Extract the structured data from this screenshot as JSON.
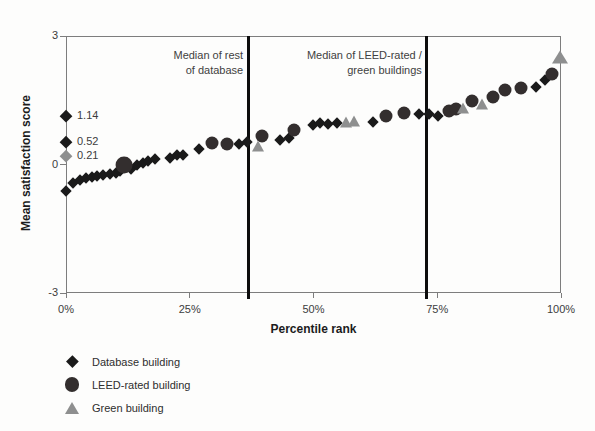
{
  "chart_data": {
    "type": "scatter",
    "title": "",
    "xlabel": "Percentile rank",
    "ylabel": "Mean satisfaction score",
    "xlim": [
      0,
      100
    ],
    "ylim": [
      -3,
      3
    ],
    "grid": false,
    "legend_position": "bottom-left",
    "xticks": [
      {
        "value": 0,
        "label": "0%"
      },
      {
        "value": 25,
        "label": "25%"
      },
      {
        "value": 50,
        "label": "50%"
      },
      {
        "value": 75,
        "label": "75%"
      },
      {
        "value": 100,
        "label": "100%"
      }
    ],
    "yticks": [
      {
        "value": 3,
        "label": "3"
      },
      {
        "value": 0,
        "label": "0"
      },
      {
        "value": -3,
        "label": "-3"
      }
    ],
    "series": [
      {
        "name": "Database building",
        "shape": "diamond",
        "color": "#1a1a1a",
        "points": [
          [
            0,
            -0.62
          ],
          [
            1.5,
            -0.44
          ],
          [
            2.8,
            -0.37
          ],
          [
            4.0,
            -0.32
          ],
          [
            5.2,
            -0.29
          ],
          [
            6.3,
            -0.27
          ],
          [
            7.5,
            -0.24
          ],
          [
            8.8,
            -0.23
          ],
          [
            10.0,
            -0.2
          ],
          [
            11.0,
            -0.16
          ],
          [
            13.2,
            -0.1
          ],
          [
            14.4,
            -0.01
          ],
          [
            15.6,
            0.04
          ],
          [
            16.6,
            0.08
          ],
          [
            18.0,
            0.13
          ],
          [
            21.0,
            0.16
          ],
          [
            22.4,
            0.22
          ],
          [
            23.6,
            0.23
          ],
          [
            26.8,
            0.37
          ],
          [
            35.0,
            0.49
          ],
          [
            36.6,
            0.52
          ],
          [
            43.3,
            0.57
          ],
          [
            45.0,
            0.63
          ],
          [
            49.8,
            0.92
          ],
          [
            51.4,
            0.97
          ],
          [
            53.0,
            0.94
          ],
          [
            54.8,
            0.96
          ],
          [
            62.0,
            0.99
          ],
          [
            71.3,
            1.17
          ],
          [
            73.3,
            1.17
          ],
          [
            75.2,
            1.13
          ],
          [
            95.0,
            1.82
          ],
          [
            96.8,
            1.97
          ]
        ]
      },
      {
        "name": "LEED-rated  building",
        "shape": "circle",
        "color": "#332e2e",
        "points": [
          [
            11.8,
            -0.02,
            1.3
          ],
          [
            29.4,
            0.5
          ],
          [
            32.6,
            0.49
          ],
          [
            39.5,
            0.67
          ],
          [
            46.0,
            0.8
          ],
          [
            64.7,
            1.14
          ],
          [
            68.2,
            1.2
          ],
          [
            77.3,
            1.25
          ],
          [
            78.8,
            1.3
          ],
          [
            82.0,
            1.48
          ],
          [
            86.3,
            1.58
          ],
          [
            88.6,
            1.74
          ],
          [
            91.9,
            1.79
          ],
          [
            98.2,
            2.12
          ]
        ]
      },
      {
        "name": "Green building",
        "shape": "triangle",
        "color": "#8e8f8f",
        "points": [
          [
            38.7,
            0.41
          ],
          [
            56.5,
            0.97
          ],
          [
            58.2,
            1.0
          ],
          [
            80.3,
            1.3
          ],
          [
            84.0,
            1.39
          ],
          [
            99.8,
            2.49,
            1.25
          ]
        ]
      }
    ],
    "median_lines": [
      {
        "x_pct": 36.8,
        "label_line1": "Median of rest",
        "label_line2": "of database"
      },
      {
        "x_pct": 72.9,
        "label_line1": "Median of LEED-rated /",
        "label_line2": "green buildings"
      }
    ],
    "reference_markers": [
      {
        "value": 1.14,
        "label": "1.14",
        "shape": "diamond",
        "color": "#1a1a1a"
      },
      {
        "value": 0.52,
        "label": "0.52",
        "shape": "diamond",
        "color": "#1a1a1a"
      },
      {
        "value": 0.21,
        "label": "0.21",
        "shape": "diamond",
        "color": "#8e8f8f"
      }
    ],
    "colors": {
      "axis": "#7d7d7d",
      "median_line": "#0d0d0d",
      "text": "#3c3c3c"
    }
  }
}
